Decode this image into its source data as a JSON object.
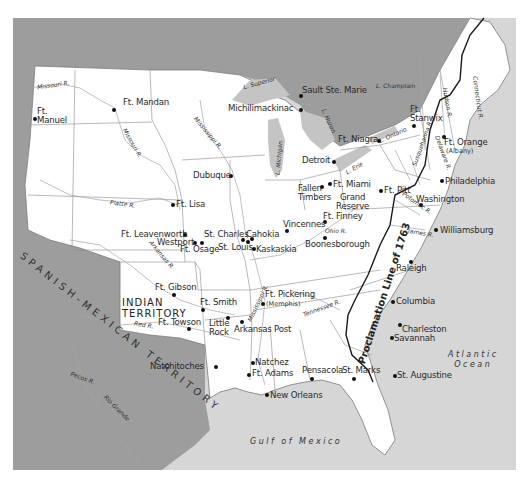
{
  "colors": {
    "land": "#ffffff",
    "foreign_land": "#9d9d9d",
    "water": "#d6d6d6",
    "lake": "#c4c4c4",
    "border": "#7a7a7a",
    "river": "#9a9a9a",
    "proclamation_line": "#1a1a1a",
    "text": "#2a2a2a"
  },
  "regions": {
    "spanish_mexican": "SPANISH-MEXICAN TERRITORY",
    "indian_territory": "INDIAN\nTERRITORY",
    "proclamation_line": "Proclamation Line of 1763"
  },
  "water_bodies": {
    "gulf": "Gulf of Mexico",
    "atlantic": "Atlantic\nOcean"
  },
  "lakes": {
    "superior": "L. Superior",
    "michigan": "L. Michigan",
    "huron": "L. Huron",
    "erie": "L. Erie",
    "ontario": "L. Ontario",
    "champlain": "L. Champlain"
  },
  "rivers": {
    "missouri_upper": "Missouri R.",
    "missouri_mid": "Missouri R.",
    "mississippi_upper": "Mississippi R.",
    "mississippi_lower": "Mississippi R.",
    "platte": "Platte R.",
    "arkansas": "Arkansas R.",
    "red": "Red R.",
    "ohio": "Ohio R.",
    "tennessee": "Tennessee R.",
    "pecos": "Pecos R.",
    "rio_grande": "Rio Grande",
    "hudson": "Hudson R.",
    "connecticut": "Connecticut R.",
    "susquehanna": "Susquehanna R.",
    "delaware": "Delaware R.",
    "potomac": "Potomac R.",
    "james": "James R."
  },
  "places": [
    {
      "id": "ft-manuel",
      "name": "Ft.\nManuel"
    },
    {
      "id": "ft-mandan",
      "name": "Ft. Mandan"
    },
    {
      "id": "sault-ste-marie",
      "name": "Sault Ste. Marie"
    },
    {
      "id": "michilimackinac",
      "name": "Michilimackinac"
    },
    {
      "id": "ft-niagra",
      "name": "Ft. Niagra"
    },
    {
      "id": "ft-stanwix",
      "name": "Ft.\nStanwix"
    },
    {
      "id": "ft-orange",
      "name": "Ft. Orange"
    },
    {
      "id": "detroit",
      "name": "Detroit"
    },
    {
      "id": "dubuque",
      "name": "Dubuque"
    },
    {
      "id": "fallen-timbers",
      "name": "Fallen\nTimbers"
    },
    {
      "id": "ft-miami",
      "name": "Ft. Miami"
    },
    {
      "id": "grand-reserve",
      "name": "Grand\nReserve"
    },
    {
      "id": "ft-finney",
      "name": "Ft. Finney"
    },
    {
      "id": "ft-pitt",
      "name": "Ft. Pitt"
    },
    {
      "id": "philadelphia",
      "name": "Philadelphia"
    },
    {
      "id": "washington",
      "name": "Washington"
    },
    {
      "id": "williamsburg",
      "name": "Williamsburg"
    },
    {
      "id": "ft-lisa",
      "name": "Ft. Lisa"
    },
    {
      "id": "ft-leavenworth",
      "name": "Ft. Leavenworth"
    },
    {
      "id": "westport",
      "name": "Westport"
    },
    {
      "id": "ft-osage",
      "name": "Ft. Osage"
    },
    {
      "id": "st-charles",
      "name": "St. Charles"
    },
    {
      "id": "cahokia",
      "name": "Cahokia"
    },
    {
      "id": "st-louis",
      "name": "St. Louis"
    },
    {
      "id": "kaskaskia",
      "name": "Kaskaskia"
    },
    {
      "id": "vincennes",
      "name": "Vincennes"
    },
    {
      "id": "boonesborough",
      "name": "Boonesborough"
    },
    {
      "id": "raleigh",
      "name": "Raleigh"
    },
    {
      "id": "ft-gibson",
      "name": "Ft. Gibson"
    },
    {
      "id": "ft-smith",
      "name": "Ft. Smith"
    },
    {
      "id": "ft-towson",
      "name": "Ft. Towson"
    },
    {
      "id": "little-rock",
      "name": "Little\nRock"
    },
    {
      "id": "arkansas-post",
      "name": "Arkansas Post"
    },
    {
      "id": "ft-pickering",
      "name": "Ft. Pickering"
    },
    {
      "id": "columbia",
      "name": "Columbia"
    },
    {
      "id": "charleston",
      "name": "Charleston"
    },
    {
      "id": "savannah",
      "name": "Savannah"
    },
    {
      "id": "natchitoches",
      "name": "Natchitoches"
    },
    {
      "id": "natchez",
      "name": "Natchez"
    },
    {
      "id": "ft-adams",
      "name": "Ft. Adams"
    },
    {
      "id": "pensacola",
      "name": "Pensacola"
    },
    {
      "id": "st-marks",
      "name": "St. Marks"
    },
    {
      "id": "st-augustine",
      "name": "St. Augustine"
    },
    {
      "id": "new-orleans",
      "name": "New Orleans"
    }
  ],
  "subtitles": {
    "ft_orange": "(Albany)",
    "ft_pickering": "(Memphis)"
  }
}
